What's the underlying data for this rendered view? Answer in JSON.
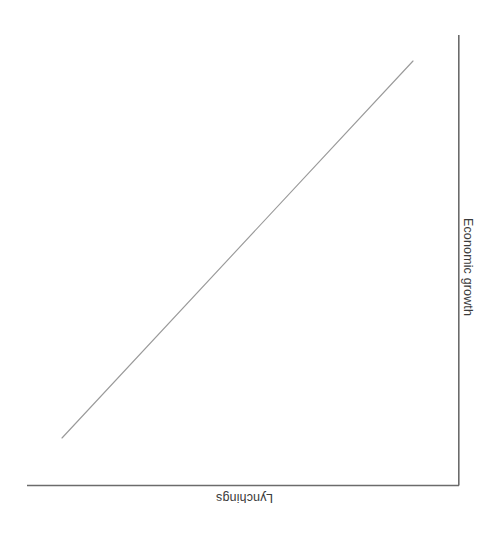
{
  "figure": {
    "background_color": "#ffffff",
    "orientation_note": "figure rendered rotated 180 degrees",
    "axis_color": "#6b6b6b",
    "line_color": "#9a9a9a",
    "text_color": "#3b3b3b"
  },
  "labels": {
    "x_axis_title": "Lynchings",
    "y_axis_title": "Economic growth"
  },
  "chart_data": {
    "type": "line",
    "title": "",
    "subtitle": "",
    "xlabel": "Lynchings",
    "ylabel": "Economic growth",
    "x": [
      0,
      1
    ],
    "series": [
      {
        "name": "Economic growth vs Lynchings",
        "values": [
          0,
          1
        ],
        "color": "#9a9a9a",
        "description": "single straight positively-sloped line, no markers"
      }
    ],
    "xlim": [
      0,
      1
    ],
    "ylim": [
      0,
      1
    ],
    "xticks": [],
    "yticks": [],
    "xticklabels": [],
    "yticklabels": [],
    "grid": false,
    "legend": false,
    "legend_position": "none",
    "annotations": [],
    "axes_spines": {
      "bottom": true,
      "right": true,
      "top": false,
      "left": false
    }
  }
}
